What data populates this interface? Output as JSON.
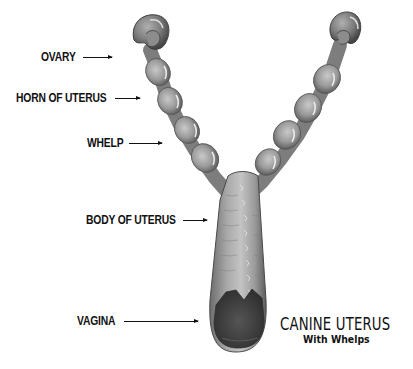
{
  "diagram": {
    "title": "CANINE UTERUS",
    "subtitle": "With Whelps",
    "labels": [
      {
        "id": "ovary",
        "text": "OVARY"
      },
      {
        "id": "horn",
        "text": "HORN OF UTERUS"
      },
      {
        "id": "whelp",
        "text": "WHELP"
      },
      {
        "id": "body",
        "text": "BODY OF UTERUS"
      },
      {
        "id": "vagina",
        "text": "VAGINA"
      }
    ],
    "colors": {
      "background": "#ffffff",
      "text": "#111111",
      "tissue_light": "#b8b8b8",
      "tissue_mid": "#8a8a8a",
      "tissue_dark": "#4a4a4a",
      "opening": "#3a3a3a"
    }
  }
}
